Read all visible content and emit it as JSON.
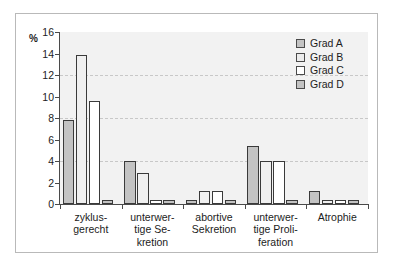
{
  "chart_data": {
    "type": "bar",
    "title": "",
    "xlabel": "",
    "ylabel": "%",
    "ylim": [
      0,
      16
    ],
    "yticks": [
      0,
      2,
      4,
      6,
      8,
      10,
      12,
      14,
      16
    ],
    "ytick_labels": [
      "0",
      "2",
      "4",
      "6",
      "8",
      "10",
      "12",
      "14",
      "16"
    ],
    "grid": "horizontal-dashed",
    "gridlines": [
      4,
      8,
      12
    ],
    "legend_position": "top-right",
    "categories": [
      "zyklus-\ngerecht",
      "unterwer-\ntige Se-\nkretion",
      "abortive\nSekretion",
      "unterwer-\ntige Proli-\nferation",
      "Atrophie"
    ],
    "category_lines": [
      [
        "zyklus-",
        "gerecht"
      ],
      [
        "unterwer-",
        "tige Se-",
        "kretion"
      ],
      [
        "abortive",
        "Sekretion"
      ],
      [
        "unterwer-",
        "tige Proli-",
        "feration"
      ],
      [
        "Atrophie"
      ]
    ],
    "series": [
      {
        "name": "Grad A",
        "key": "A",
        "color": "#c3c3c3",
        "values": [
          7.8,
          4.0,
          0.4,
          5.4,
          1.2
        ]
      },
      {
        "name": "Grad B",
        "key": "B",
        "color": "#f0f0f0",
        "values": [
          13.9,
          2.9,
          1.2,
          4.0,
          0.4
        ]
      },
      {
        "name": "Grad C",
        "key": "C",
        "color": "#ffffff",
        "values": [
          9.6,
          0.4,
          1.2,
          4.0,
          0.4
        ]
      },
      {
        "name": "Grad D",
        "key": "D",
        "color": "#c3c3c3",
        "values": [
          0.4,
          0.4,
          0.4,
          0.4,
          0.4
        ]
      }
    ]
  },
  "axis": {
    "percent_symbol": "%"
  },
  "legend": {
    "entries": [
      {
        "label": "Grad A",
        "key": "A"
      },
      {
        "label": "Grad B",
        "key": "B"
      },
      {
        "label": "Grad C",
        "key": "C"
      },
      {
        "label": "Grad D",
        "key": "D"
      }
    ]
  },
  "colors": {
    "plot_background": "#f2f2f2",
    "frame_border": "#b9b9b9",
    "axis": "#4a4a4a",
    "gridline": "#c8c8c8",
    "bar_outline": "#3a3a3a",
    "text": "#1c1c1c"
  }
}
